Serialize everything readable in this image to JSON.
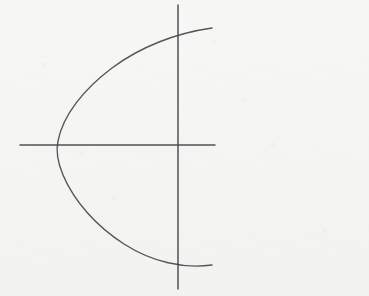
{
  "canvas": {
    "width": 369,
    "height": 296,
    "background_color": "#f7f7f6",
    "medium": "pencil-on-paper",
    "description": "Hand-drawn geometry sketch: a rightward-opening parabola crossed by a pair of straight coordinate axes."
  },
  "palette": {
    "paper": "#f7f7f6",
    "ink": "#4a4a4c",
    "ink_light": "#6d6d70",
    "smudge": "#e9e9ea"
  },
  "strokes": {
    "horizontal_axis": {
      "label": "horizontal axis",
      "x1": 20,
      "y1": 145,
      "x2": 215,
      "y2": 145,
      "width": 1.5,
      "color": "#4a4a4c"
    },
    "vertical_axis": {
      "label": "vertical axis",
      "x1": 178,
      "y1": 5,
      "x2": 178,
      "y2": 289,
      "width": 1.5,
      "color": "#4a4a4c"
    },
    "parabola": {
      "label": "parabola opening right",
      "vertex_x": 57,
      "vertex_y": 145,
      "top_end_x": 212,
      "top_end_y": 28,
      "bottom_end_x": 212,
      "bottom_end_y": 265,
      "axis_crossing_top_y": 27,
      "axis_crossing_bottom_y": 264,
      "width": 1.4,
      "color": "#4a4a4c",
      "path": "M 212 28 C 176 33 140 47 112 68 C 84 89 63 115 58 141 C 56 150 58 163 63 175 C 74 201 96 226 124 244 C 152 262 184 269 212 265"
    }
  },
  "intersection": {
    "label": "origin",
    "x": 178,
    "y": 145
  },
  "annotations": {
    "text_labels": [],
    "note": "No text, numerals, axis ticks or legend appear anywhere in the image."
  }
}
